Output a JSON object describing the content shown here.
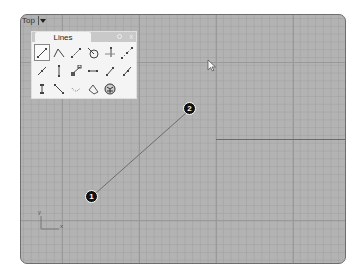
{
  "viewport": {
    "name": "Top",
    "menu_caret": "▾",
    "colors": {
      "background": "#b3b3b3",
      "grid_major": "#999999",
      "axis": "#6a6a6a"
    }
  },
  "lines_panel": {
    "tab_label": "Lines",
    "gear_icon": "gear-icon",
    "close_label": "x",
    "tools": [
      {
        "icon": "line-icon",
        "selected": true
      },
      {
        "icon": "polyline-icon"
      },
      {
        "icon": "line-segments-icon"
      },
      {
        "icon": "line-tangent-circle-icon"
      },
      {
        "icon": "line-perpendicular-icon"
      },
      {
        "icon": "multiline-points-icon"
      },
      {
        "icon": "line-from-midpoint-icon"
      },
      {
        "icon": "line-vertical-icon"
      },
      {
        "icon": "line-normal-to-surface-icon"
      },
      {
        "icon": "line-bisector-icon"
      },
      {
        "icon": "line-angled-icon"
      },
      {
        "icon": "line-extend-icon"
      },
      {
        "icon": "line-vertical-both-icon"
      },
      {
        "icon": "line-diagonal-icon"
      },
      {
        "icon": "arc-tangent-icon"
      },
      {
        "icon": "polygon-shape-icon"
      },
      {
        "icon": "sphere-mesh-icon"
      }
    ]
  },
  "drawing": {
    "points": [
      {
        "label": "1",
        "x": 71,
        "y": 182
      },
      {
        "label": "2",
        "x": 169,
        "y": 94
      }
    ]
  },
  "axis_indicator": {
    "x_label": "x",
    "y_label": "y"
  }
}
